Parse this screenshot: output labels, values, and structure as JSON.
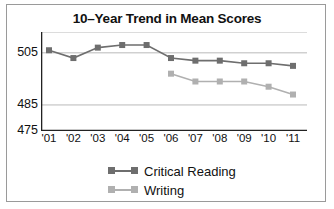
{
  "figure": {
    "title": "10–Year Trend in Mean Scores",
    "frame_color": "#9a9a9a",
    "background": "#ffffff"
  },
  "chart_data": {
    "type": "line",
    "title": "10–Year Trend in Mean Scores",
    "xlabel": "",
    "ylabel": "",
    "categories": [
      "'01",
      "'02",
      "'03",
      "'04",
      "'05",
      "'06",
      "'07",
      "'08",
      "'09",
      "'10",
      "'11"
    ],
    "yticks": [
      475,
      485,
      505
    ],
    "ylim": [
      475,
      513
    ],
    "gridlines": [
      485,
      505,
      513
    ],
    "grid": true,
    "legend_position": "bottom-center",
    "series": [
      {
        "name": "Critical Reading",
        "color": "#6e6e6e",
        "marker": "square",
        "values": [
          506,
          503,
          507,
          508,
          508,
          503,
          502,
          502,
          501,
          501,
          500
        ]
      },
      {
        "name": "Writing",
        "color": "#b0b0b0",
        "marker": "square",
        "values": [
          null,
          null,
          null,
          null,
          null,
          497,
          494,
          494,
          494,
          492,
          489
        ]
      }
    ]
  },
  "legend": {
    "items": [
      {
        "label": "Critical Reading",
        "color": "#6e6e6e"
      },
      {
        "label": "Writing",
        "color": "#b0b0b0"
      }
    ]
  }
}
